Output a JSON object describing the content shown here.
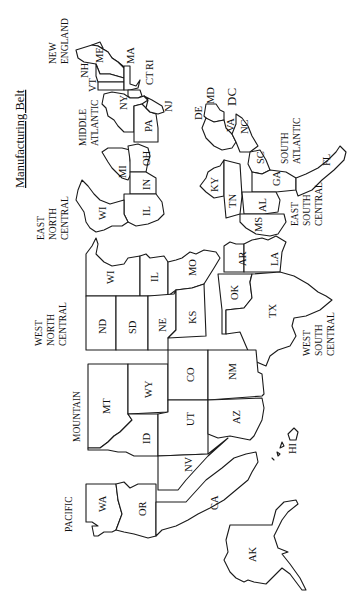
{
  "map": {
    "title": "Manufacturing Belt",
    "orientation": "rotated 90° counter-clockwise",
    "colors": {
      "background": "#ffffff",
      "outline": "#1a1a1a",
      "text": "#111111"
    },
    "regions": [
      {
        "id": "new_england",
        "lines": [
          "NEW",
          "ENGLAND"
        ]
      },
      {
        "id": "middle_atlantic",
        "lines": [
          "MIDDLE",
          "ATLANTIC"
        ]
      },
      {
        "id": "east_north_central",
        "lines": [
          "EAST",
          "NORTH",
          "CENTRAL"
        ]
      },
      {
        "id": "south_atlantic",
        "lines": [
          "SOUTH",
          "ATLANTIC"
        ]
      },
      {
        "id": "east_south_central",
        "lines": [
          "EAST",
          "SOUTH",
          "CENTRAL"
        ]
      },
      {
        "id": "west_north_central",
        "lines": [
          "WEST",
          "NORTH",
          "CENTRAL"
        ]
      },
      {
        "id": "west_south_central",
        "lines": [
          "WEST",
          "SOUTH",
          "CENTRAL"
        ]
      },
      {
        "id": "mountain",
        "lines": [
          "MOUNTAIN"
        ]
      },
      {
        "id": "pacific",
        "lines": [
          "PACIFIC"
        ]
      }
    ],
    "states": {
      "ME": "ME",
      "NH": "NH",
      "VT": "VT",
      "MA": "MA",
      "CT": "CT",
      "RI": "RI",
      "NY": "NY",
      "PA": "PA",
      "NJ": "NJ",
      "WI": "WI",
      "MI": "MI",
      "OH": "OH",
      "IN": "IN",
      "IL": "IL",
      "DE": "DE",
      "MD": "MD",
      "DC": "DC",
      "VA": "VA",
      "NC": "NC",
      "SC": "SC",
      "GA": "GA",
      "FL": "FL",
      "KY": "KY",
      "TN": "TN",
      "AL": "AL",
      "MS": "MS",
      "ND": "ND",
      "SD": "SD",
      "NE": "NE",
      "KS": "KS",
      "MN": "WI",
      "IA": "IL",
      "MO": "MO",
      "OK": "OK",
      "AR": "AR",
      "LA": "LA",
      "TX": "TX",
      "MT": "MT",
      "WY": "WY",
      "CO": "CO",
      "NM": "NM",
      "ID": "ID",
      "UT": "UT",
      "AZ": "AZ",
      "NV": "NV",
      "WA": "WA",
      "OR": "OR",
      "CA": "CA",
      "AK": "AK",
      "HI": "HI"
    }
  }
}
